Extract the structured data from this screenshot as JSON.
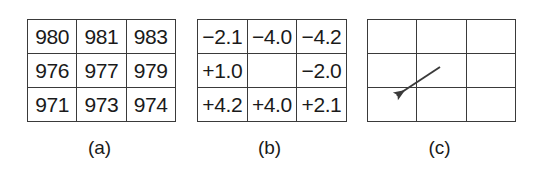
{
  "figure": {
    "background_color": "#ffffff",
    "line_color": "#3a3a3a",
    "text_color": "#1a1a1a",
    "panels": [
      {
        "id": "a",
        "caption": "(a)",
        "kind": "value-grid",
        "rows": [
          [
            "980",
            "981",
            "983"
          ],
          [
            "976",
            "977",
            "979"
          ],
          [
            "971",
            "973",
            "974"
          ]
        ]
      },
      {
        "id": "b",
        "caption": "(b)",
        "kind": "difference-grid",
        "rows": [
          [
            "−2.1",
            "−4.0",
            "−4.2"
          ],
          [
            "+1.0",
            "",
            "−2.0"
          ],
          [
            "+4.2",
            "+4.0",
            "+2.1"
          ]
        ]
      },
      {
        "id": "c",
        "caption": "(c)",
        "kind": "arrow-grid",
        "rows": [
          [
            "",
            "",
            ""
          ],
          [
            "",
            "",
            ""
          ],
          [
            "",
            "",
            ""
          ]
        ],
        "arrow": {
          "name": "gradient-direction-arrow",
          "tail_x": 73,
          "tail_y": 48,
          "head_x": 26,
          "head_y": 79,
          "color": "#3a3a3a"
        }
      }
    ]
  }
}
